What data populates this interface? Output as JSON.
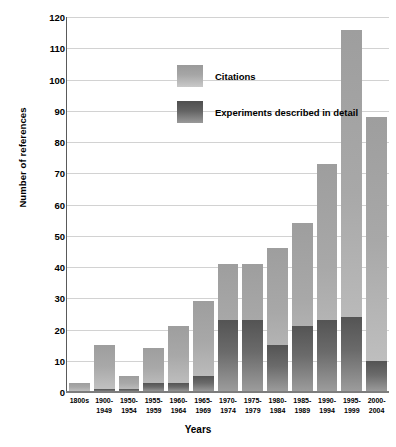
{
  "chart_data": {
    "type": "bar",
    "stacked": true,
    "title": "",
    "xlabel": "Years",
    "ylabel": "Number of references",
    "ylim": [
      0,
      120
    ],
    "ytick_step": 10,
    "yticks": [
      0,
      10,
      20,
      30,
      40,
      50,
      60,
      70,
      80,
      90,
      100,
      110,
      120
    ],
    "grid": true,
    "legend_position": "inside-top-left",
    "categories": [
      "1800s",
      "1900-1949",
      "1950-1954",
      "1955-1959",
      "1960-1964",
      "1965-1969",
      "1970-1974",
      "1975-1979",
      "1980-1984",
      "1985-1989",
      "1990-1994",
      "1995-1999",
      "2000-2004"
    ],
    "category_lines": [
      [
        "1800s",
        ""
      ],
      [
        "1900-",
        "1949"
      ],
      [
        "1950-",
        "1954"
      ],
      [
        "1955-",
        "1959"
      ],
      [
        "1960-",
        "1964"
      ],
      [
        "1965-",
        "1969"
      ],
      [
        "1970-",
        "1974"
      ],
      [
        "1975-",
        "1979"
      ],
      [
        "1980-",
        "1984"
      ],
      [
        "1985-",
        "1989"
      ],
      [
        "1990-",
        "1994"
      ],
      [
        "1995-",
        "1999"
      ],
      [
        "2000-",
        "2004"
      ]
    ],
    "series": [
      {
        "name": "Citations",
        "color": "#a8a8a8",
        "values": [
          3,
          15,
          5,
          14,
          21,
          29,
          41,
          41,
          46,
          54,
          73,
          116,
          88
        ]
      },
      {
        "name": "Experiments described in detail",
        "color": "#636363",
        "values": [
          0,
          1,
          1,
          3,
          3,
          5,
          23,
          23,
          15,
          21,
          23,
          24,
          10
        ]
      }
    ]
  },
  "legend": {
    "items": [
      {
        "label": "Citations"
      },
      {
        "label": "Experiments described in detail"
      }
    ]
  },
  "axes": {
    "y_title": "Number of references",
    "x_title": "Years"
  }
}
